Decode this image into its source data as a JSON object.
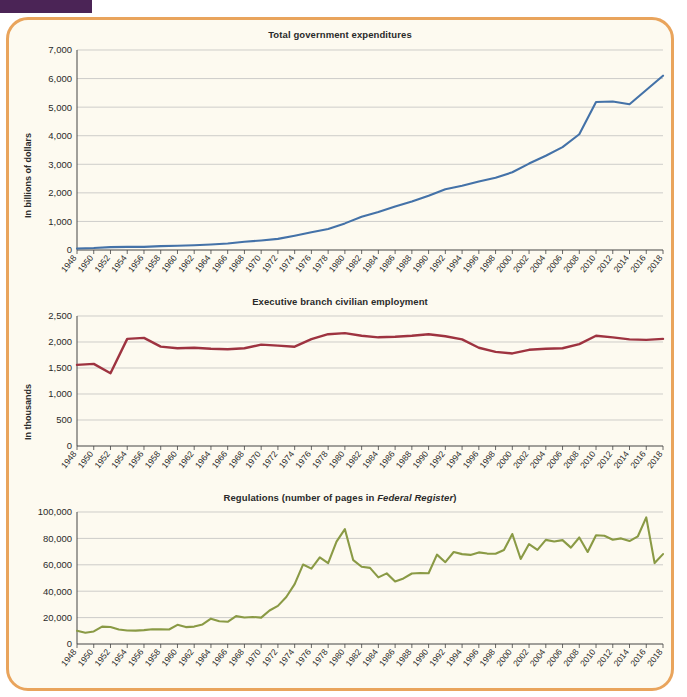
{
  "header": {
    "tab_label": "",
    "note": ""
  },
  "figure": {
    "border_color": "#e9a45c",
    "background_color": "#fdfaf0"
  },
  "chart_data": [
    {
      "type": "line",
      "title": "Total government expenditures",
      "xlabel": "",
      "ylabel": "In billions of dollars",
      "ylim": [
        0,
        7000
      ],
      "yticks": [
        0,
        1000,
        2000,
        3000,
        4000,
        5000,
        6000,
        7000
      ],
      "ytick_labels": [
        "0",
        "1,000",
        "2,000",
        "3,000",
        "4,000",
        "5,000",
        "6,000",
        "7,000"
      ],
      "grid": true,
      "legend": "none",
      "color": "#4472a8",
      "x": [
        1948,
        1950,
        1952,
        1954,
        1956,
        1958,
        1960,
        1962,
        1964,
        1966,
        1968,
        1970,
        1972,
        1974,
        1976,
        1978,
        1980,
        1982,
        1984,
        1986,
        1988,
        1990,
        1992,
        1994,
        1996,
        1998,
        2000,
        2002,
        2004,
        2006,
        2008,
        2010,
        2012,
        2014,
        2016,
        2018
      ],
      "values": [
        55,
        70,
        99,
        110,
        110,
        134,
        151,
        167,
        191,
        225,
        287,
        332,
        390,
        500,
        620,
        738,
        931,
        1166,
        1327,
        1522,
        1695,
        1900,
        2125,
        2250,
        2400,
        2530,
        2720,
        3025,
        3300,
        3600,
        4050,
        5180,
        5200,
        5100,
        5600,
        6100
      ],
      "tick_labels": [
        "1948",
        "1950",
        "1952",
        "1954",
        "1956",
        "1958",
        "1960",
        "1962",
        "1964",
        "1966",
        "1968",
        "1970",
        "1972",
        "1974",
        "1976",
        "1978",
        "1980",
        "1982",
        "1984",
        "1986",
        "1988",
        "1990",
        "1992",
        "1994",
        "1996",
        "1998",
        "2000",
        "2002",
        "2004",
        "2006",
        "2008",
        "2010",
        "2012",
        "2014",
        "2016",
        "2018"
      ]
    },
    {
      "type": "line",
      "title": "Executive branch civilian employment",
      "xlabel": "",
      "ylabel": "In thousands",
      "ylim": [
        0,
        2500
      ],
      "yticks": [
        0,
        500,
        1000,
        1500,
        2000,
        2500
      ],
      "ytick_labels": [
        "0",
        "500",
        "1,000",
        "1,500",
        "2,000",
        "2,500"
      ],
      "grid": true,
      "legend": "none",
      "color": "#9e3340",
      "x": [
        1948,
        1950,
        1952,
        1954,
        1956,
        1958,
        1960,
        1962,
        1964,
        1966,
        1968,
        1970,
        1972,
        1974,
        1976,
        1978,
        1980,
        1982,
        1984,
        1986,
        1988,
        1990,
        1992,
        1994,
        1996,
        1998,
        2000,
        2002,
        2004,
        2006,
        2008,
        2010,
        2012,
        2014,
        2016,
        2018
      ],
      "values": [
        1560,
        1580,
        1400,
        2060,
        2080,
        1910,
        1880,
        1890,
        1870,
        1860,
        1880,
        1950,
        1930,
        1910,
        2055,
        2150,
        2170,
        2120,
        2090,
        2100,
        2120,
        2150,
        2110,
        2050,
        1890,
        1810,
        1780,
        1850,
        1870,
        1880,
        1960,
        2120,
        2090,
        2050,
        2040,
        2060
      ],
      "tick_labels": [
        "1948",
        "1950",
        "1952",
        "1954",
        "1956",
        "1958",
        "1960",
        "1962",
        "1964",
        "1966",
        "1968",
        "1970",
        "1972",
        "1974",
        "1976",
        "1978",
        "1980",
        "1982",
        "1984",
        "1986",
        "1988",
        "1990",
        "1992",
        "1994",
        "1996",
        "1998",
        "2000",
        "2002",
        "2004",
        "2006",
        "2008",
        "2010",
        "2012",
        "2014",
        "2016",
        "2018"
      ]
    },
    {
      "type": "line",
      "title_prefix": "Regulations (number of pages in ",
      "title_italic": "Federal Register",
      "title_suffix": ")",
      "title": "Regulations (number of pages in Federal Register)",
      "xlabel": "",
      "ylabel": "",
      "ylim": [
        0,
        100000
      ],
      "yticks": [
        0,
        20000,
        40000,
        60000,
        80000,
        100000
      ],
      "ytick_labels": [
        "0",
        "20,000",
        "40,000",
        "60,000",
        "80,000",
        "100,000"
      ],
      "grid": true,
      "legend": "none",
      "color": "#8a9a45",
      "x": [
        1948,
        1949,
        1950,
        1951,
        1952,
        1953,
        1954,
        1955,
        1956,
        1957,
        1958,
        1959,
        1960,
        1961,
        1962,
        1963,
        1964,
        1965,
        1966,
        1967,
        1968,
        1969,
        1970,
        1971,
        1972,
        1973,
        1974,
        1975,
        1976,
        1977,
        1978,
        1979,
        1980,
        1981,
        1982,
        1983,
        1984,
        1985,
        1986,
        1987,
        1988,
        1989,
        1990,
        1991,
        1992,
        1993,
        1994,
        1995,
        1996,
        1997,
        1998,
        1999,
        2000,
        2001,
        2002,
        2003,
        2004,
        2005,
        2006,
        2007,
        2008,
        2009,
        2010,
        2011,
        2012,
        2013,
        2014,
        2015,
        2016,
        2017,
        2018
      ],
      "values": [
        10000,
        8500,
        9500,
        13200,
        12900,
        11000,
        10200,
        10100,
        10500,
        11200,
        11100,
        11000,
        14500,
        12800,
        13200,
        14800,
        19200,
        17200,
        16800,
        21100,
        20100,
        20500,
        20000,
        25400,
        28900,
        35600,
        45400,
        60200,
        57100,
        65600,
        61200,
        77500,
        87000,
        63500,
        58500,
        57700,
        50500,
        53500,
        47400,
        49700,
        53400,
        53800,
        53600,
        67700,
        62000,
        69700,
        68100,
        67500,
        69400,
        68500,
        68400,
        71200,
        83300,
        64400,
        75700,
        71300,
        78900,
        77700,
        78700,
        73000,
        80700,
        69700,
        82400,
        82000,
        79000,
        80000,
        78000,
        81600,
        95900,
        61300,
        68100
      ],
      "tick_labels": [
        "1948",
        "1950",
        "1952",
        "1954",
        "1956",
        "1958",
        "1960",
        "1962",
        "1964",
        "1966",
        "1968",
        "1970",
        "1972",
        "1974",
        "1976",
        "1978",
        "1980",
        "1982",
        "1984",
        "1986",
        "1988",
        "1990",
        "1992",
        "1994",
        "1996",
        "1998",
        "2000",
        "2002",
        "2004",
        "2006",
        "2008",
        "2010",
        "2012",
        "2014",
        "2016",
        "2018"
      ]
    }
  ]
}
